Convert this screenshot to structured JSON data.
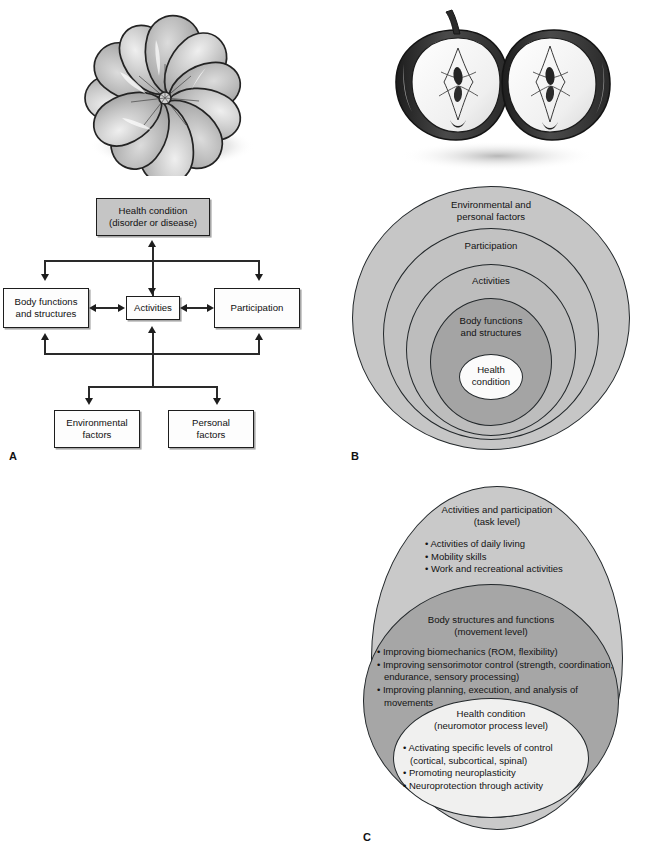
{
  "figure": {
    "panels": [
      "A",
      "B",
      "C"
    ]
  },
  "illustrations": {
    "orange": {
      "name": "segmented-orange-illustration",
      "alt": "Peeled orange showing individual segments arranged in a ring",
      "segments": 11
    },
    "apple": {
      "name": "halved-apple-illustration",
      "alt": "Two halves of an apple cut lengthwise showing core and seeds",
      "halves": 2
    }
  },
  "panelA": {
    "label": "A",
    "boxes": [
      {
        "id": "health-condition",
        "line1": "Health condition",
        "line2": "(disorder or disease)",
        "shaded": true
      },
      {
        "id": "body-functions",
        "line1": "Body functions",
        "line2": "and structures",
        "shaded": false
      },
      {
        "id": "activities",
        "line1": "Activities",
        "line2": "",
        "shaded": false
      },
      {
        "id": "participation",
        "line1": "Participation",
        "line2": "",
        "shaded": false
      },
      {
        "id": "environmental-factors",
        "line1": "Environmental",
        "line2": "factors",
        "shaded": false
      },
      {
        "id": "personal-factors",
        "line1": "Personal",
        "line2": "factors",
        "shaded": false
      }
    ]
  },
  "panelB": {
    "label": "B",
    "rings": [
      {
        "id": "environmental-personal-factors",
        "line1": "Environmental and",
        "line2": "personal factors",
        "fill": "#c6c6c6"
      },
      {
        "id": "participation",
        "line1": "Participation",
        "line2": "",
        "fill": "#c2c2c2"
      },
      {
        "id": "activities",
        "line1": "Activities",
        "line2": "",
        "fill": "#bdbdbd"
      },
      {
        "id": "body-functions-structures",
        "line1": "Body functions",
        "line2": "and structures",
        "fill": "#a4a4a4"
      },
      {
        "id": "health-condition",
        "line1": "Health",
        "line2": "condition",
        "fill": "#fbfbfb"
      }
    ]
  },
  "panelC": {
    "label": "C",
    "levels": [
      {
        "id": "activities-and-participation",
        "title": "Activities and participation",
        "subtitle": "(task level)",
        "fill": "#c9c9c9",
        "bullets": [
          "• Activities of daily living",
          "• Mobility skills",
          "• Work and recreational activities"
        ]
      },
      {
        "id": "body-structures-and-functions",
        "title": "Body structures and functions",
        "subtitle": "(movement level)",
        "fill": "#a6a6a6",
        "bullets": [
          "• Improving biomechanics (ROM, flexibility)",
          "• Improving sensorimotor control (strength, coordination, endurance, sensory processing)",
          "• Improving planning, execution, and analysis of movements"
        ]
      },
      {
        "id": "health-condition",
        "title": "Health condition",
        "subtitle": "(neuromotor process level)",
        "fill": "#f0f0ef",
        "bullets": [
          "• Activating specific levels of control (cortical, subcortical, spinal)",
          "• Promoting neuroplasticity",
          "• Neuroprotection through activity"
        ]
      }
    ]
  }
}
